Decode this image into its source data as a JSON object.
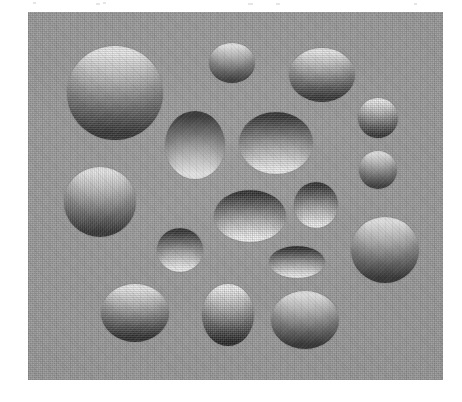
{
  "figure": {
    "canvas": {
      "width": 462,
      "height": 402,
      "background": "#ffffff"
    },
    "panel": {
      "x": 28,
      "y": 12,
      "width": 415,
      "height": 368,
      "background": "#9a9a9a",
      "texture": "halftone-scan-noise"
    },
    "shading": {
      "light_direction": "above",
      "convex_label": "convex",
      "concave_label": "concave",
      "highlight_color": "#f2f2f2",
      "shadow_color": "#2c2c2c",
      "midtone_color": "#8e8e8e"
    },
    "counts": {
      "total": 17,
      "convex": 10,
      "concave": 7
    },
    "blobs": [
      {
        "id": "blob-01",
        "name": "large-sphere-top-left",
        "cx": 115,
        "cy": 93,
        "rx": 48,
        "ry": 47,
        "shading": "convex",
        "light_top": "#eeeeee",
        "dark_bottom": "#2e2e2e"
      },
      {
        "id": "blob-02",
        "name": "small-sphere-top-center",
        "cx": 232,
        "cy": 63,
        "rx": 23,
        "ry": 20,
        "shading": "convex",
        "light_top": "#efefef",
        "dark_bottom": "#333333"
      },
      {
        "id": "blob-03",
        "name": "ellipse-top-right",
        "cx": 322,
        "cy": 75,
        "rx": 33,
        "ry": 27,
        "shading": "convex",
        "light_top": "#ededed",
        "dark_bottom": "#303030"
      },
      {
        "id": "blob-04",
        "name": "small-circle-right-upper",
        "cx": 378,
        "cy": 118,
        "rx": 20,
        "ry": 20,
        "shading": "convex",
        "light_top": "#eeeeee",
        "dark_bottom": "#343434"
      },
      {
        "id": "blob-05",
        "name": "dimple-center-left",
        "cx": 195,
        "cy": 145,
        "rx": 30,
        "ry": 34,
        "shading": "concave",
        "light_top": "#2b2b2b",
        "dark_bottom": "#f2f2f2"
      },
      {
        "id": "blob-06",
        "name": "dimple-center-wide",
        "cx": 276,
        "cy": 143,
        "rx": 37,
        "ry": 31,
        "shading": "concave",
        "light_top": "#2d2d2d",
        "dark_bottom": "#f0f0f0"
      },
      {
        "id": "blob-07",
        "name": "small-circle-right-middle",
        "cx": 378,
        "cy": 170,
        "rx": 19,
        "ry": 19,
        "shading": "convex",
        "light_top": "#ebebeb",
        "dark_bottom": "#363636"
      },
      {
        "id": "blob-08",
        "name": "sphere-left-middle",
        "cx": 100,
        "cy": 202,
        "rx": 36,
        "ry": 35,
        "shading": "convex",
        "light_top": "#ececec",
        "dark_bottom": "#2f2f2f"
      },
      {
        "id": "blob-09",
        "name": "dimple-center-lower",
        "cx": 250,
        "cy": 216,
        "rx": 36,
        "ry": 26,
        "shading": "concave",
        "light_top": "#2a2a2a",
        "dark_bottom": "#f3f3f3"
      },
      {
        "id": "blob-10",
        "name": "dimple-small-right-center",
        "cx": 316,
        "cy": 205,
        "rx": 22,
        "ry": 23,
        "shading": "concave",
        "light_top": "#2e2e2e",
        "dark_bottom": "#eeeeee"
      },
      {
        "id": "blob-11",
        "name": "dimple-small-left-lower",
        "cx": 180,
        "cy": 250,
        "rx": 23,
        "ry": 22,
        "shading": "concave",
        "light_top": "#2c2c2c",
        "dark_bottom": "#f1f1f1"
      },
      {
        "id": "blob-12",
        "name": "sphere-right-lower",
        "cx": 385,
        "cy": 250,
        "rx": 34,
        "ry": 33,
        "shading": "convex",
        "light_top": "#efefef",
        "dark_bottom": "#2e2e2e"
      },
      {
        "id": "blob-13",
        "name": "flat-dimple-lower-center",
        "cx": 297,
        "cy": 262,
        "rx": 28,
        "ry": 16,
        "shading": "concave",
        "light_top": "#2b2b2b",
        "dark_bottom": "#efefef"
      },
      {
        "id": "blob-14",
        "name": "sphere-bottom-left",
        "cx": 135,
        "cy": 313,
        "rx": 34,
        "ry": 29,
        "shading": "convex",
        "light_top": "#ededed",
        "dark_bottom": "#2d2d2d"
      },
      {
        "id": "blob-15",
        "name": "egg-bottom-center",
        "cx": 228,
        "cy": 315,
        "rx": 26,
        "ry": 31,
        "shading": "convex",
        "light_top": "#f0f0f0",
        "dark_bottom": "#292929"
      },
      {
        "id": "blob-16",
        "name": "ellipse-bottom-right",
        "cx": 305,
        "cy": 320,
        "rx": 34,
        "ry": 29,
        "shading": "convex",
        "light_top": "#ececec",
        "dark_bottom": "#2e2e2e"
      },
      {
        "id": "blob-17",
        "name": "dimple-upper-left-of-center",
        "cx": 190,
        "cy": 142,
        "rx": 0,
        "ry": 0,
        "shading": "concave",
        "light_top": "#2b2b2b",
        "dark_bottom": "#f2f2f2"
      }
    ]
  }
}
